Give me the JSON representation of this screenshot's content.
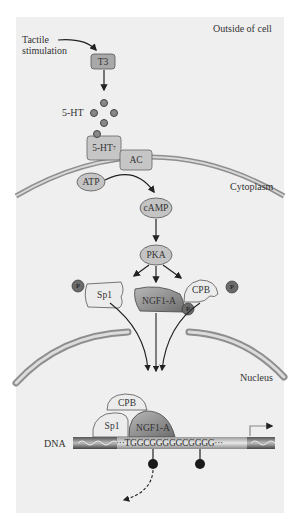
{
  "diagram": {
    "regions": {
      "outside": "Outside of cell",
      "cytoplasm": "Cytoplasm",
      "nucleus": "Nucleus"
    },
    "stimulus": [
      "Tactile",
      "stimulation"
    ],
    "nodes": {
      "t3": "T3",
      "ht5": "5-HT",
      "receptor": "5-HT",
      "receptor_sub": "7",
      "ac": "AC",
      "atp": "ATP",
      "camp": "cAMP",
      "pka": "PKA",
      "sp1": "Sp1",
      "ngf1a": "NGF1-A",
      "cpb": "CPB",
      "phospho": "P"
    },
    "dna": {
      "label": "DNA",
      "sequence": "···TGGCGGGGGCGGGG···"
    },
    "complex": {
      "cpb": "CPB",
      "sp1": "Sp1",
      "ngf1a": "NGF1-A"
    },
    "colors": {
      "panel_bg": "#efefef",
      "membrane": "#9a9a9a",
      "node_fill": "#c4c4c4",
      "t3_fill": "#a9a9a9",
      "ngf1a_fill": "#8c8c8c",
      "phospho_fill": "#6a6a6a",
      "methyl": "#1a1a1a"
    }
  }
}
